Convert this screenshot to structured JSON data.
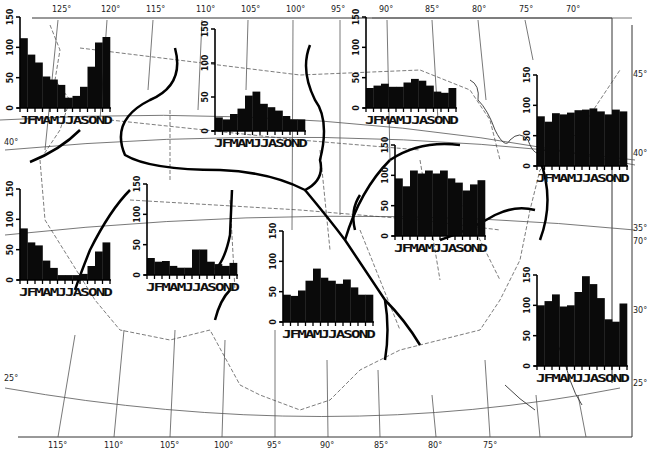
{
  "chart_data": {
    "type": "bar",
    "title": "",
    "categories": [
      "J",
      "F",
      "M",
      "A",
      "M",
      "J",
      "J",
      "A",
      "S",
      "O",
      "N",
      "D"
    ],
    "month_axis_label": "JFMAMJJASOND",
    "ylim": [
      0,
      150
    ],
    "yticks": [
      0,
      50,
      100,
      150
    ],
    "series": [
      {
        "name": "Pacific Northwest",
        "values": [
          115,
          88,
          75,
          52,
          47,
          38,
          17,
          20,
          35,
          68,
          108,
          117
        ]
      },
      {
        "name": "California",
        "values": [
          85,
          62,
          57,
          32,
          20,
          8,
          8,
          8,
          10,
          23,
          47,
          62
        ]
      },
      {
        "name": "Northern Rockies / Plains",
        "values": [
          20,
          17,
          25,
          33,
          52,
          58,
          40,
          35,
          30,
          22,
          17,
          17
        ]
      },
      {
        "name": "Southwest",
        "values": [
          28,
          22,
          23,
          15,
          12,
          12,
          42,
          42,
          22,
          18,
          15,
          20
        ]
      },
      {
        "name": "Southern Plains",
        "values": [
          45,
          43,
          52,
          68,
          88,
          73,
          68,
          63,
          70,
          57,
          45,
          45
        ]
      },
      {
        "name": "Upper Midwest",
        "values": [
          33,
          37,
          40,
          35,
          35,
          42,
          48,
          45,
          37,
          27,
          25,
          33
        ]
      },
      {
        "name": "Ohio Valley",
        "values": [
          95,
          82,
          108,
          103,
          108,
          103,
          108,
          95,
          88,
          75,
          85,
          92
        ]
      },
      {
        "name": "Northeast",
        "values": [
          82,
          73,
          87,
          85,
          88,
          92,
          93,
          95,
          90,
          85,
          93,
          90
        ]
      },
      {
        "name": "Southeast",
        "values": [
          100,
          107,
          118,
          98,
          100,
          122,
          148,
          135,
          112,
          77,
          73,
          103
        ]
      }
    ],
    "map": {
      "top_longitudes": [
        "125°",
        "120°",
        "115°",
        "110°",
        "105°",
        "100°",
        "95°",
        "90°",
        "85°",
        "80°",
        "75°",
        "70°"
      ],
      "bottom_longitudes": [
        "115°",
        "110°",
        "105°",
        "100°",
        "95°",
        "90°",
        "85°",
        "80°",
        "75°"
      ],
      "left_latitudes": [
        "40°",
        "25°"
      ],
      "right_latitudes": [
        "45°",
        "40°",
        "35°",
        "30°",
        "25°"
      ],
      "right_extra_longitude": "70°"
    }
  }
}
